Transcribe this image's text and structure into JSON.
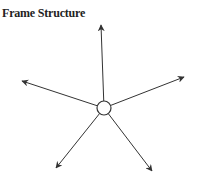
{
  "title": "Frame Structure",
  "diagram": {
    "center": {
      "x": 104,
      "y": 108,
      "r": 7
    },
    "arrows": [
      {
        "name": "up",
        "x": 101,
        "y": 25
      },
      {
        "name": "upper-right",
        "x": 184,
        "y": 77
      },
      {
        "name": "upper-left",
        "x": 22,
        "y": 81
      },
      {
        "name": "lower-left",
        "x": 56,
        "y": 168
      },
      {
        "name": "lower-right",
        "x": 152,
        "y": 171
      }
    ],
    "stroke_color": "#333333"
  }
}
